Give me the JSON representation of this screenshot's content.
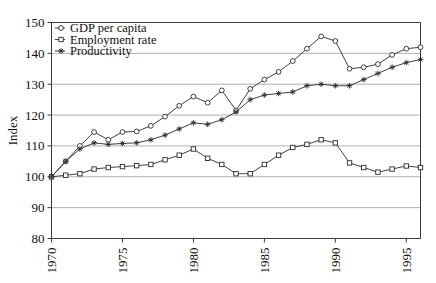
{
  "chart_data": {
    "type": "line",
    "title": "",
    "subtitle": "",
    "xlabel": "",
    "ylabel": "Index",
    "xlim": [
      1970,
      1996
    ],
    "ylim": [
      80,
      150
    ],
    "ytick_values": [
      80,
      90,
      100,
      110,
      120,
      130,
      140,
      150
    ],
    "ytick_labels": [
      "80",
      "90",
      "100",
      "110",
      "120",
      "130",
      "140",
      "150"
    ],
    "xtick_values": [
      1970,
      1975,
      1980,
      1985,
      1990,
      1995
    ],
    "xtick_labels": [
      "1970",
      "1975",
      "1980",
      "1985",
      "1990",
      "1995"
    ],
    "grid": "horizontal",
    "legend_position": "top-left",
    "x": [
      1970,
      1971,
      1972,
      1973,
      1974,
      1975,
      1976,
      1977,
      1978,
      1979,
      1980,
      1981,
      1982,
      1983,
      1984,
      1985,
      1986,
      1987,
      1988,
      1989,
      1990,
      1991,
      1992,
      1993,
      1994,
      1995,
      1996
    ],
    "series": [
      {
        "name": "GDP per capita",
        "marker": "open-circle",
        "values": [
          100.0,
          105.0,
          110.0,
          114.5,
          112.0,
          114.5,
          114.7,
          116.5,
          119.5,
          123.0,
          126.0,
          124.0,
          128.0,
          121.5,
          128.5,
          131.5,
          134.0,
          137.5,
          141.5,
          145.5,
          144.0,
          135.0,
          135.5,
          136.5,
          139.5,
          141.5,
          142.0
        ]
      },
      {
        "name": "Employment rate",
        "marker": "open-square",
        "values": [
          100.0,
          100.5,
          101.0,
          102.5,
          103.0,
          103.3,
          103.6,
          104.0,
          105.5,
          107.0,
          109.0,
          106.0,
          104.0,
          101.0,
          101.0,
          104.0,
          107.0,
          109.5,
          110.5,
          112.0,
          111.0,
          104.5,
          103.0,
          101.5,
          102.5,
          103.5,
          103.0
        ]
      },
      {
        "name": "Productivity",
        "marker": "star",
        "values": [
          100.0,
          105.0,
          109.0,
          111.0,
          110.5,
          110.8,
          111.0,
          112.0,
          113.5,
          115.5,
          117.5,
          117.0,
          118.5,
          121.0,
          125.0,
          126.5,
          127.0,
          127.5,
          129.5,
          130.0,
          129.5,
          129.5,
          131.5,
          133.5,
          135.5,
          137.0,
          138.0
        ]
      }
    ]
  },
  "legend": {
    "items": [
      {
        "label": "GDP per capita",
        "marker": "open-circle"
      },
      {
        "label": "Employment rate",
        "marker": "open-square"
      },
      {
        "label": "Productivity",
        "marker": "star"
      }
    ]
  },
  "axes": {
    "y_title": "Index"
  }
}
